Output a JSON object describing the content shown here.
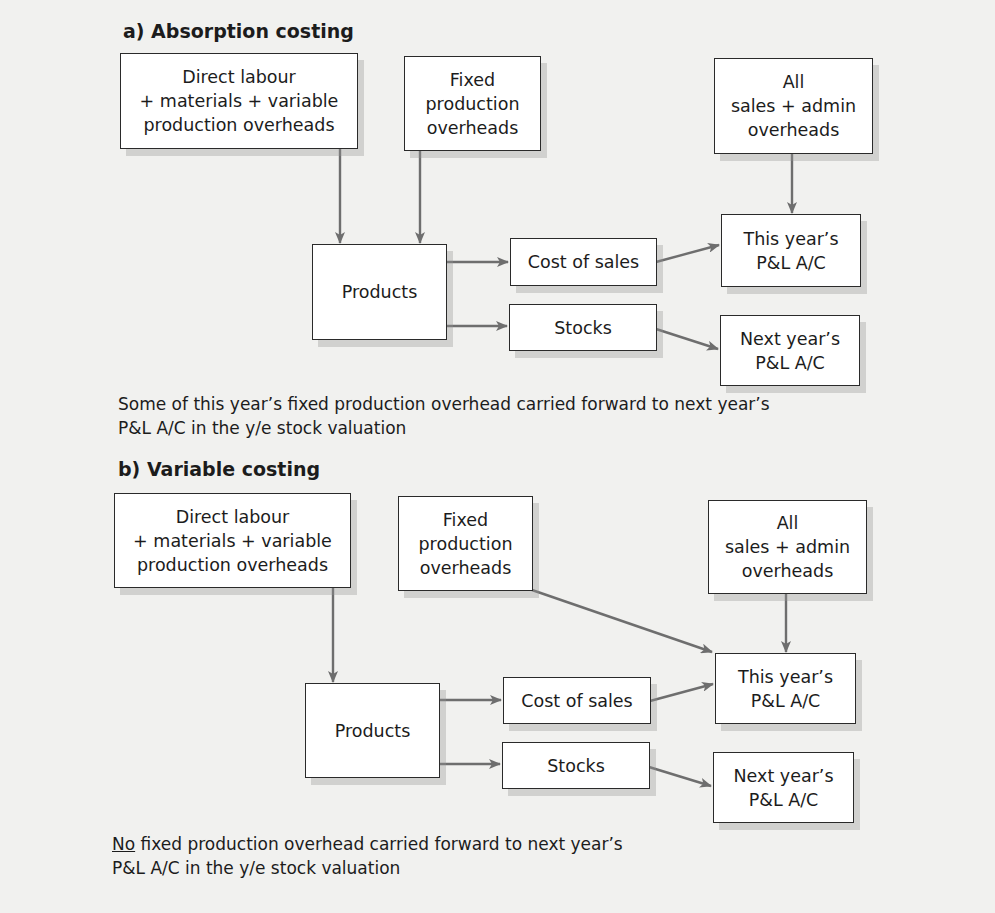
{
  "sections": {
    "absorption": {
      "title": "a) Absorption costing",
      "boxes": {
        "direct": "Direct labour\n+ materials + variable\nproduction overheads",
        "fixed": "Fixed\nproduction\noverheads",
        "sales_admin": "All\nsales + admin\noverheads",
        "products": "Products",
        "cost_of_sales": "Cost of sales",
        "stocks": "Stocks",
        "this_year": "This year’s\nP&L A/C",
        "next_year": "Next year’s\nP&L A/C"
      },
      "caption_line1": "Some of this year’s fixed production overhead carried forward to next year’s",
      "caption_line2": "P&L A/C in the y/e stock valuation"
    },
    "variable": {
      "title": "b) Variable costing",
      "boxes": {
        "direct": "Direct labour\n+ materials + variable\nproduction overheads",
        "fixed": "Fixed\nproduction\noverheads",
        "sales_admin": "All\nsales + admin\noverheads",
        "products": "Products",
        "cost_of_sales": "Cost of sales",
        "stocks": "Stocks",
        "this_year": "This year’s\nP&L A/C",
        "next_year": "Next year’s\nP&L A/C"
      },
      "caption_emphasis": "No",
      "caption_line1_rest": " fixed production overhead carried forward to next year’s",
      "caption_line2": "P&L A/C in the y/e stock valuation"
    }
  },
  "colors": {
    "background": "#f1f1ef",
    "arrow": "#6e6e6e",
    "box_border": "#2a2a2a",
    "box_fill": "#ffffff"
  }
}
